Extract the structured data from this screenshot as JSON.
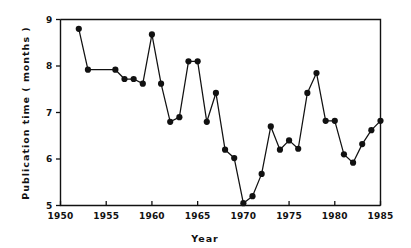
{
  "chart_data": {
    "type": "line",
    "title": "",
    "xlabel": "Year",
    "ylabel": "Publication time ( months )",
    "xlim": [
      1950,
      1985
    ],
    "ylim": [
      5,
      9
    ],
    "grid": false,
    "legend": null,
    "xticks": [
      1950,
      1955,
      1960,
      1965,
      1970,
      1975,
      1980,
      1985
    ],
    "xtick_labels": [
      "1950",
      "1955",
      "1960",
      "1965",
      "1970",
      "1975",
      "1980",
      "1985"
    ],
    "yticks": [
      5,
      6,
      7,
      8,
      9
    ],
    "ytick_labels": [
      "5",
      "6",
      "7",
      "8",
      "9"
    ],
    "marker": "filled-circle",
    "marker_color": "#111111",
    "line_color": "#111111",
    "x": [
      1952,
      1953,
      1956,
      1957,
      1958,
      1959,
      1960,
      1961,
      1962,
      1963,
      1964,
      1965,
      1966,
      1967,
      1968,
      1969,
      1970,
      1971,
      1972,
      1973,
      1974,
      1975,
      1976,
      1977,
      1978,
      1979,
      1980,
      1981,
      1982,
      1983,
      1984,
      1985
    ],
    "values": [
      8.8,
      7.92,
      7.92,
      7.72,
      7.72,
      7.62,
      8.68,
      7.62,
      6.8,
      6.9,
      8.1,
      8.1,
      6.8,
      7.42,
      6.2,
      6.02,
      5.05,
      5.2,
      5.68,
      6.7,
      6.2,
      6.4,
      6.22,
      7.42,
      7.85,
      6.82,
      6.82,
      6.1,
      5.92,
      6.32,
      6.62,
      6.82
    ],
    "series": [
      {
        "name": "Publication time",
        "values": [
          8.8,
          7.92,
          7.92,
          7.72,
          7.72,
          7.62,
          8.68,
          7.62,
          6.8,
          6.9,
          8.1,
          8.1,
          6.8,
          7.42,
          6.2,
          6.02,
          5.05,
          5.2,
          5.68,
          6.7,
          6.2,
          6.4,
          6.22,
          7.42,
          7.85,
          6.82,
          6.82,
          6.1,
          5.92,
          6.32,
          6.62,
          6.82
        ]
      }
    ]
  }
}
